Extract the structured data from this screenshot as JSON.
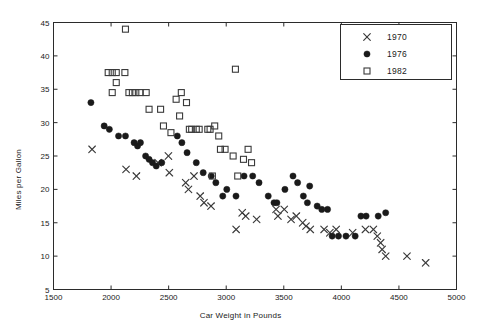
{
  "chart_data": {
    "type": "scatter",
    "title": "",
    "xlabel": "Car Weight in Pounds",
    "ylabel": "Miles per Gallon",
    "xlim": [
      1500,
      5000
    ],
    "ylim": [
      5,
      45
    ],
    "xticks": [
      1500,
      2000,
      2500,
      3000,
      3500,
      4000,
      4500,
      5000
    ],
    "yticks": [
      5,
      10,
      15,
      20,
      25,
      30,
      35,
      40,
      45
    ],
    "grid": false,
    "legend_position": "top-right",
    "marker_color": "#1a1a1a",
    "series": [
      {
        "name": "1970",
        "marker": "x",
        "points": [
          [
            1835,
            26.0
          ],
          [
            2130,
            23.0
          ],
          [
            2408,
            24.0
          ],
          [
            2498,
            25.0
          ],
          [
            2220,
            22.0
          ],
          [
            2506,
            22.5
          ],
          [
            2648,
            21.0
          ],
          [
            2672,
            20.0
          ],
          [
            2720,
            22.0
          ],
          [
            2774,
            19.0
          ],
          [
            2807,
            18.0
          ],
          [
            2868,
            17.5
          ],
          [
            3086,
            14.0
          ],
          [
            3139,
            16.5
          ],
          [
            3169,
            16.0
          ],
          [
            3264,
            15.5
          ],
          [
            3433,
            17.0
          ],
          [
            3449,
            16.0
          ],
          [
            3504,
            17.0
          ],
          [
            3563,
            15.5
          ],
          [
            3609,
            16.0
          ],
          [
            3664,
            15.0
          ],
          [
            3693,
            14.5
          ],
          [
            3730,
            14.0
          ],
          [
            3850,
            14.0
          ],
          [
            3900,
            13.5
          ],
          [
            3955,
            14.0
          ],
          [
            4098,
            13.5
          ],
          [
            4209,
            14.0
          ],
          [
            4278,
            14.0
          ],
          [
            4312,
            13.0
          ],
          [
            4341,
            12.0
          ],
          [
            4354,
            11.0
          ],
          [
            4385,
            10.0
          ],
          [
            4570,
            10.0
          ],
          [
            4732,
            9.0
          ]
        ]
      },
      {
        "name": "1976",
        "marker": "o",
        "points": [
          [
            1825,
            33.0
          ],
          [
            1940,
            29.5
          ],
          [
            1985,
            29.0
          ],
          [
            2065,
            28.0
          ],
          [
            2125,
            28.0
          ],
          [
            2200,
            27.0
          ],
          [
            2230,
            26.5
          ],
          [
            2255,
            27.0
          ],
          [
            2300,
            25.0
          ],
          [
            2330,
            24.5
          ],
          [
            2360,
            24.0
          ],
          [
            2392,
            23.5
          ],
          [
            2440,
            24.0
          ],
          [
            2575,
            28.0
          ],
          [
            2615,
            27.0
          ],
          [
            2660,
            25.5
          ],
          [
            2740,
            24.0
          ],
          [
            2800,
            22.5
          ],
          [
            2870,
            22.0
          ],
          [
            2910,
            21.0
          ],
          [
            2970,
            19.0
          ],
          [
            3005,
            20.0
          ],
          [
            3085,
            19.0
          ],
          [
            3155,
            22.0
          ],
          [
            3230,
            22.0
          ],
          [
            3285,
            21.0
          ],
          [
            3365,
            19.0
          ],
          [
            3415,
            18.0
          ],
          [
            3440,
            18.0
          ],
          [
            3510,
            20.0
          ],
          [
            3580,
            22.0
          ],
          [
            3620,
            21.0
          ],
          [
            3670,
            19.0
          ],
          [
            3705,
            18.0
          ],
          [
            3725,
            20.5
          ],
          [
            3790,
            17.5
          ],
          [
            3830,
            17.0
          ],
          [
            3880,
            17.0
          ],
          [
            3920,
            13.0
          ],
          [
            3975,
            13.0
          ],
          [
            4040,
            13.0
          ],
          [
            4120,
            13.0
          ],
          [
            4170,
            16.0
          ],
          [
            4215,
            16.0
          ],
          [
            4320,
            16.0
          ],
          [
            4385,
            16.5
          ]
        ]
      },
      {
        "name": "1982",
        "marker": "s",
        "points": [
          [
            1975,
            37.5
          ],
          [
            2010,
            37.5
          ],
          [
            2045,
            37.5
          ],
          [
            2045,
            36.0
          ],
          [
            2010,
            34.5
          ],
          [
            2120,
            37.5
          ],
          [
            2125,
            44.0
          ],
          [
            2155,
            34.5
          ],
          [
            2185,
            34.5
          ],
          [
            2215,
            34.5
          ],
          [
            2250,
            34.5
          ],
          [
            2305,
            34.5
          ],
          [
            2330,
            32.0
          ],
          [
            2430,
            32.0
          ],
          [
            2455,
            29.5
          ],
          [
            2520,
            28.5
          ],
          [
            2565,
            33.5
          ],
          [
            2610,
            34.5
          ],
          [
            2655,
            33.0
          ],
          [
            2595,
            31.0
          ],
          [
            2680,
            29.0
          ],
          [
            2700,
            29.0
          ],
          [
            2740,
            29.0
          ],
          [
            2765,
            29.0
          ],
          [
            2840,
            29.0
          ],
          [
            2860,
            29.0
          ],
          [
            2900,
            29.5
          ],
          [
            2935,
            28.0
          ],
          [
            3080,
            38.0
          ],
          [
            2950,
            26.0
          ],
          [
            2990,
            26.0
          ],
          [
            3060,
            25.0
          ],
          [
            3150,
            24.5
          ],
          [
            3190,
            26.0
          ],
          [
            3220,
            24.0
          ],
          [
            2880,
            22.0
          ],
          [
            3100,
            22.0
          ]
        ]
      }
    ]
  },
  "legend": {
    "entries": [
      {
        "label": "1970",
        "marker": "x"
      },
      {
        "label": "1976",
        "marker": "o"
      },
      {
        "label": "1982",
        "marker": "s"
      }
    ]
  }
}
